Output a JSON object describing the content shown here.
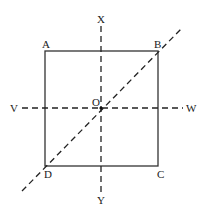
{
  "diagram": {
    "type": "geometry-symmetry",
    "square": {
      "vertices": [
        {
          "id": "A",
          "label": "A",
          "x": 45,
          "y": 51
        },
        {
          "id": "B",
          "label": "B",
          "x": 158,
          "y": 51
        },
        {
          "id": "C",
          "label": "C",
          "x": 158,
          "y": 166
        },
        {
          "id": "D",
          "label": "D",
          "x": 45,
          "y": 166
        }
      ],
      "stroke": "#333333"
    },
    "center": {
      "label": "O",
      "x": 101,
      "y": 108
    },
    "axes": [
      {
        "id": "XY",
        "from_label": "X",
        "to_label": "Y",
        "x1": 101,
        "y1": 26,
        "x2": 101,
        "y2": 193,
        "style": "dashed"
      },
      {
        "id": "VW",
        "from_label": "V",
        "to_label": "W",
        "x1": 22,
        "y1": 108,
        "x2": 183,
        "y2": 108,
        "style": "dashed"
      },
      {
        "id": "DB",
        "from_label": "",
        "to_label": "",
        "x1": 22,
        "y1": 191,
        "x2": 181,
        "y2": 29,
        "style": "dashed"
      }
    ],
    "labels": {
      "A": "A",
      "B": "B",
      "C": "C",
      "D": "D",
      "O": "O",
      "X": "X",
      "Y": "Y",
      "V": "V",
      "W": "W"
    },
    "colors": {
      "line": "#2a2a2a",
      "text": "#1a1a1a",
      "background": "#ffffff"
    }
  }
}
